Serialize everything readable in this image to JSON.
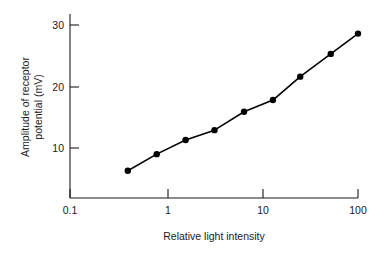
{
  "chart_data": {
    "type": "line",
    "title": "",
    "xlabel": "Relative light intensity",
    "ylabel": "Amplitude of receptor potential (mV)",
    "ylabel_line1": "Amplitude of receptor",
    "ylabel_line2": "potential (mV)",
    "xscale": "log",
    "yscale": "linear",
    "xlim": [
      0.1,
      100
    ],
    "ylim": [
      0,
      32
    ],
    "grid": false,
    "legend": false,
    "xticks": [
      "0.1",
      "1",
      "10",
      "100"
    ],
    "xtick_values": [
      0.1,
      1,
      10,
      100
    ],
    "yticks": [
      "10",
      "20",
      "30"
    ],
    "ytick_values": [
      10,
      20,
      30
    ],
    "x": [
      0.4,
      0.8,
      1.6,
      3.2,
      6.5,
      13,
      25,
      52,
      100
    ],
    "values": [
      6.3,
      9.0,
      11.3,
      12.9,
      15.9,
      17.8,
      21.6,
      25.3,
      28.6
    ],
    "series": [
      {
        "name": "Receptor potential",
        "marker": "filled-circle",
        "color": "#000000",
        "values": [
          6.3,
          9.0,
          11.3,
          12.9,
          15.9,
          17.8,
          21.6,
          25.3,
          28.6
        ]
      }
    ]
  }
}
